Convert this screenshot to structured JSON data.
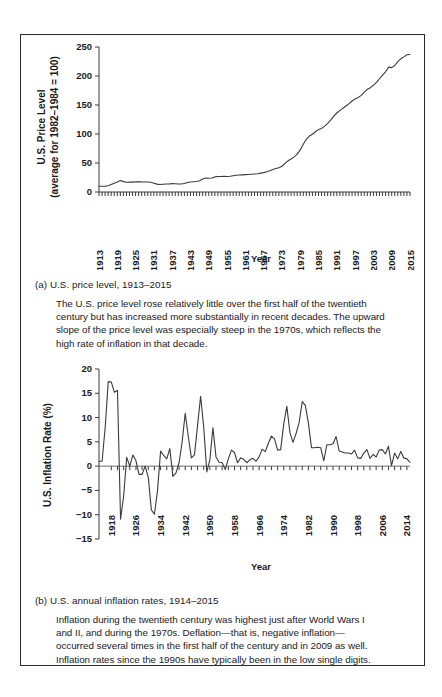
{
  "figure": {
    "border_color": "#2b2b2b",
    "line_color": "#3a3a3a",
    "panel_a": {
      "caption_label": "(a) U.S. price level, 1913–2015",
      "body_lines": [
        "The U.S. price level rose relatively little over the first half of the twentieth",
        "century but has increased more substantially in recent decades. The upward",
        "slope of the price level was especially steep in the 1970s, which reflects the",
        "high rate of inflation in that decade."
      ]
    },
    "panel_b": {
      "caption_label": "(b) U.S. annual inflation rates, 1914–2015",
      "body_lines": [
        "Inflation during the twentieth century was highest just after World Wars I",
        "and II, and during the 1970s. Deflation—that is, negative inflation—",
        "occurred several times in the first half of the century and in 2009 as well.",
        "Inflation rates since the 1990s have typically been in the low single digits."
      ]
    }
  },
  "chart_data": [
    {
      "type": "line",
      "id": "price-level",
      "title": "(a) U.S. price level, 1913–2015",
      "xlabel": "Year",
      "ylabel": "U.S. Price Level (average for 1982–1984 = 100)",
      "ylabel_line1": "U.S. Price Level",
      "ylabel_line2": "(average for 1982–1984 = 100)",
      "ylim": [
        0,
        250
      ],
      "yticks": [
        0,
        50,
        100,
        150,
        200,
        250
      ],
      "xlim": [
        1913,
        2015
      ],
      "xticks": [
        1913,
        1919,
        1925,
        1931,
        1937,
        1943,
        1949,
        1955,
        1961,
        1967,
        1973,
        1979,
        1985,
        1991,
        1997,
        2003,
        2009,
        2015
      ],
      "xtick_step": 6,
      "minor_tick_step": 1,
      "grid": false,
      "legend": "none",
      "x": [
        1913,
        1914,
        1915,
        1916,
        1917,
        1918,
        1919,
        1920,
        1921,
        1922,
        1923,
        1924,
        1925,
        1926,
        1927,
        1928,
        1929,
        1930,
        1931,
        1932,
        1933,
        1934,
        1935,
        1936,
        1937,
        1938,
        1939,
        1940,
        1941,
        1942,
        1943,
        1944,
        1945,
        1946,
        1947,
        1948,
        1949,
        1950,
        1951,
        1952,
        1953,
        1954,
        1955,
        1956,
        1957,
        1958,
        1959,
        1960,
        1961,
        1962,
        1963,
        1964,
        1965,
        1966,
        1967,
        1968,
        1969,
        1970,
        1971,
        1972,
        1973,
        1974,
        1975,
        1976,
        1977,
        1978,
        1979,
        1980,
        1981,
        1982,
        1983,
        1984,
        1985,
        1986,
        1987,
        1988,
        1989,
        1990,
        1991,
        1992,
        1993,
        1994,
        1995,
        1996,
        1997,
        1998,
        1999,
        2000,
        2001,
        2002,
        2003,
        2004,
        2005,
        2006,
        2007,
        2008,
        2009,
        2010,
        2011,
        2012,
        2013,
        2014,
        2015
      ],
      "values": [
        9.9,
        10.0,
        10.1,
        10.9,
        12.8,
        15.1,
        17.3,
        20.0,
        17.9,
        16.8,
        17.1,
        17.1,
        17.5,
        17.7,
        17.4,
        17.2,
        17.2,
        16.7,
        15.2,
        13.6,
        12.9,
        13.4,
        13.7,
        13.9,
        14.4,
        14.1,
        13.9,
        14.0,
        14.7,
        16.3,
        17.3,
        17.6,
        18.0,
        19.5,
        22.3,
        24.0,
        23.8,
        24.1,
        26.0,
        26.6,
        26.8,
        26.9,
        26.8,
        27.2,
        28.1,
        28.9,
        29.2,
        29.6,
        29.9,
        30.3,
        30.6,
        31.0,
        31.5,
        32.5,
        33.4,
        34.8,
        36.7,
        38.8,
        40.5,
        41.8,
        44.4,
        49.3,
        53.8,
        56.9,
        60.6,
        65.2,
        72.6,
        82.4,
        90.9,
        96.5,
        99.6,
        103.9,
        107.6,
        109.6,
        113.6,
        118.3,
        124.0,
        130.7,
        136.2,
        140.3,
        144.5,
        148.2,
        152.4,
        156.9,
        160.5,
        163.0,
        166.6,
        172.2,
        177.1,
        179.9,
        184.0,
        188.9,
        195.3,
        201.6,
        207.3,
        215.3,
        214.5,
        218.1,
        224.9,
        229.6,
        233.0,
        236.7,
        237.0
      ]
    },
    {
      "type": "line",
      "id": "inflation-rate",
      "title": "(b) U.S. annual inflation rates, 1914–2015",
      "xlabel": "Year",
      "ylabel": "U.S. Inflation Rate (%)",
      "ylim": [
        -15,
        20
      ],
      "yticks": [
        -15,
        -10,
        -5,
        0,
        5,
        10,
        15,
        20
      ],
      "xlim": [
        1914,
        2015
      ],
      "xticks": [
        1918,
        1926,
        1934,
        1942,
        1950,
        1958,
        1966,
        1974,
        1982,
        1990,
        1998,
        2006,
        2014
      ],
      "xtick_step": 8,
      "minor_tick_step": 2,
      "grid": false,
      "legend": "none",
      "zero_line": true,
      "x": [
        1914,
        1915,
        1916,
        1917,
        1918,
        1919,
        1920,
        1921,
        1922,
        1923,
        1924,
        1925,
        1926,
        1927,
        1928,
        1929,
        1930,
        1931,
        1932,
        1933,
        1934,
        1935,
        1936,
        1937,
        1938,
        1939,
        1940,
        1941,
        1942,
        1943,
        1944,
        1945,
        1946,
        1947,
        1948,
        1949,
        1950,
        1951,
        1952,
        1953,
        1954,
        1955,
        1956,
        1957,
        1958,
        1959,
        1960,
        1961,
        1962,
        1963,
        1964,
        1965,
        1966,
        1967,
        1968,
        1969,
        1970,
        1971,
        1972,
        1973,
        1974,
        1975,
        1976,
        1977,
        1978,
        1979,
        1980,
        1981,
        1982,
        1983,
        1984,
        1985,
        1986,
        1987,
        1988,
        1989,
        1990,
        1991,
        1992,
        1993,
        1994,
        1995,
        1996,
        1997,
        1998,
        1999,
        2000,
        2001,
        2002,
        2003,
        2004,
        2005,
        2006,
        2007,
        2008,
        2009,
        2010,
        2011,
        2012,
        2013,
        2014,
        2015
      ],
      "values": [
        1.0,
        1.0,
        7.9,
        17.4,
        17.3,
        15.2,
        15.6,
        -10.9,
        -6.2,
        1.8,
        0.0,
        2.3,
        1.1,
        -1.7,
        -1.7,
        0.0,
        -2.3,
        -9.0,
        -9.9,
        -5.1,
        3.1,
        2.2,
        1.5,
        3.6,
        -2.1,
        -1.4,
        0.7,
        5.0,
        10.9,
        6.1,
        1.7,
        2.3,
        8.3,
        14.4,
        8.1,
        -1.2,
        1.3,
        7.9,
        1.9,
        0.8,
        0.7,
        -0.7,
        1.5,
        3.3,
        2.8,
        0.7,
        1.7,
        1.4,
        0.7,
        1.3,
        1.6,
        1.0,
        1.9,
        3.5,
        3.0,
        4.7,
        6.2,
        5.6,
        3.3,
        3.4,
        8.7,
        12.3,
        6.9,
        4.9,
        6.7,
        9.0,
        13.3,
        12.5,
        8.9,
        3.8,
        3.8,
        3.9,
        3.8,
        1.1,
        4.4,
        4.4,
        4.6,
        6.1,
        3.1,
        2.9,
        2.7,
        2.7,
        2.5,
        3.3,
        1.7,
        1.6,
        2.7,
        3.4,
        1.6,
        2.4,
        1.9,
        3.3,
        3.4,
        2.5,
        4.1,
        0.1,
        2.7,
        1.5,
        3.0,
        1.7,
        1.5,
        0.8,
        0.7,
        1.6
      ]
    }
  ]
}
